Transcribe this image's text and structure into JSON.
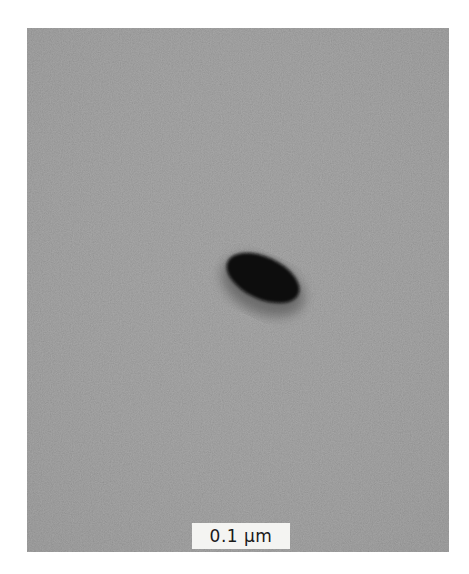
{
  "figure": {
    "type": "electron micrograph",
    "background_color": "#8c8c8c",
    "particle_color": "#0a0a0a",
    "halo_color": "#5e5e5e"
  },
  "scale_bar": {
    "label": "0.1 μm"
  }
}
